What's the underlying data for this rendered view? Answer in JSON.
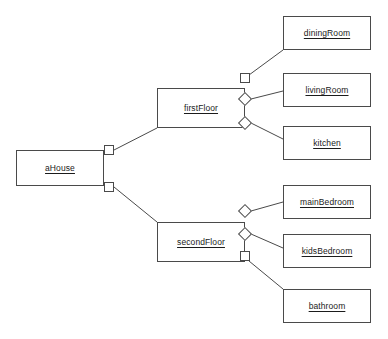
{
  "diagram": {
    "type": "uml-object-diagram",
    "background_color": "#ffffff",
    "line_color": "#4a4a4a",
    "text_color": "#1b1b1b",
    "nodes": [
      {
        "id": "aHouse",
        "label": "aHouse",
        "x": 16,
        "y": 150,
        "w": 88,
        "h": 36
      },
      {
        "id": "firstFloor",
        "label": "firstFloor",
        "x": 157,
        "y": 88,
        "w": 88,
        "h": 40
      },
      {
        "id": "secondFloor",
        "label": "secondFloor",
        "x": 157,
        "y": 222,
        "w": 88,
        "h": 40
      },
      {
        "id": "diningRoom",
        "label": "diningRoom",
        "x": 283,
        "y": 16,
        "w": 88,
        "h": 34
      },
      {
        "id": "livingRoom",
        "label": "livingRoom",
        "x": 283,
        "y": 73,
        "w": 88,
        "h": 34
      },
      {
        "id": "kitchen",
        "label": "kitchen",
        "x": 283,
        "y": 126,
        "w": 88,
        "h": 34
      },
      {
        "id": "mainBedroom",
        "label": "mainBedroom",
        "x": 283,
        "y": 185,
        "w": 88,
        "h": 34
      },
      {
        "id": "kidsBedroom",
        "label": "kidsBedroom",
        "x": 283,
        "y": 234,
        "w": 88,
        "h": 34
      },
      {
        "id": "bathroom",
        "label": "bathroom",
        "x": 283,
        "y": 289,
        "w": 88,
        "h": 34
      }
    ],
    "connectors": [
      {
        "id": "c-house-first",
        "owner": "aHouse",
        "shape": "square",
        "x": 104,
        "y": 145,
        "size": 10
      },
      {
        "id": "c-house-second",
        "owner": "aHouse",
        "shape": "square",
        "x": 104,
        "y": 182,
        "size": 10
      },
      {
        "id": "c-first-dining",
        "owner": "firstFloor",
        "shape": "square",
        "x": 240,
        "y": 73,
        "size": 10
      },
      {
        "id": "c-first-living",
        "owner": "firstFloor",
        "shape": "diamond",
        "x": 240,
        "y": 94,
        "size": 10
      },
      {
        "id": "c-first-kitchen",
        "owner": "firstFloor",
        "shape": "diamond",
        "x": 240,
        "y": 118,
        "size": 10
      },
      {
        "id": "c-second-main",
        "owner": "secondFloor",
        "shape": "diamond",
        "x": 240,
        "y": 206,
        "size": 10
      },
      {
        "id": "c-second-kids",
        "owner": "secondFloor",
        "shape": "diamond",
        "x": 240,
        "y": 229,
        "size": 10
      },
      {
        "id": "c-second-bath",
        "owner": "secondFloor",
        "shape": "square",
        "x": 240,
        "y": 251,
        "size": 10
      }
    ],
    "edges": [
      {
        "id": "e-house-first",
        "from": "aHouse",
        "to": "firstFloor",
        "points": "114,150 157,128"
      },
      {
        "id": "e-house-second",
        "from": "aHouse",
        "to": "secondFloor",
        "points": "114,187 157,222"
      },
      {
        "id": "e-first-dining",
        "from": "firstFloor",
        "to": "diningRoom",
        "points": "249,75 283,50"
      },
      {
        "id": "e-first-living",
        "from": "firstFloor",
        "to": "livingRoom",
        "points": "251,99 283,91"
      },
      {
        "id": "e-first-kitchen",
        "from": "firstFloor",
        "to": "kitchen",
        "points": "251,123 283,139"
      },
      {
        "id": "e-second-main",
        "from": "secondFloor",
        "to": "mainBedroom",
        "points": "251,211 283,202"
      },
      {
        "id": "e-second-kids",
        "from": "secondFloor",
        "to": "kidsBedroom",
        "points": "251,234 283,248"
      },
      {
        "id": "e-second-bath",
        "from": "secondFloor",
        "to": "bathroom",
        "points": "249,261 283,289"
      }
    ]
  }
}
